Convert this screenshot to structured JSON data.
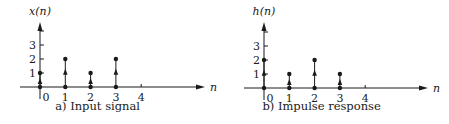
{
  "chart_data": [
    {
      "type": "stem",
      "title": "x(n)",
      "caption": "a) Input signal",
      "xlabel": "n",
      "ylabel": "x(n)",
      "x": [
        0,
        1,
        2,
        3
      ],
      "values": [
        1,
        2,
        1,
        2
      ],
      "x_ticks": [
        "0",
        "1",
        "2",
        "3",
        "4"
      ],
      "y_ticks": [
        "1",
        "2",
        "3"
      ],
      "ylim": [
        0,
        4
      ],
      "grid": false
    },
    {
      "type": "stem",
      "title": "h(n)",
      "caption": "b) Impulse response",
      "xlabel": "n",
      "ylabel": "h(n)",
      "x": [
        0,
        1,
        2,
        3
      ],
      "values": [
        2,
        1,
        2,
        1
      ],
      "x_ticks": [
        "0",
        "1",
        "2",
        "3",
        "4"
      ],
      "y_ticks": [
        "1",
        "2",
        "3"
      ],
      "ylim": [
        0,
        4
      ],
      "grid": false
    }
  ],
  "colors": {
    "ink": "#1a1a1a",
    "background": "#ffffff"
  }
}
